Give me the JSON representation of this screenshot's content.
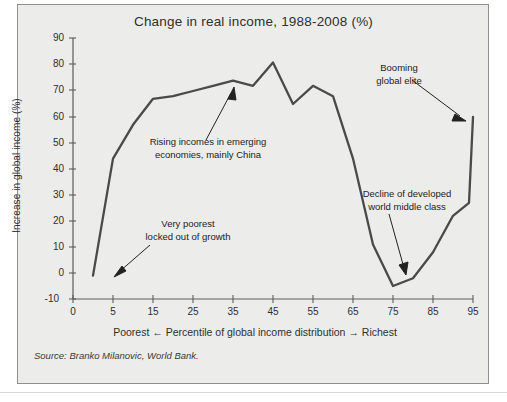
{
  "figure": {
    "title": "Change in real income, 1988-2008 (%)",
    "source": "Source: Branko Milanovic, World Bank.",
    "background_color": "#ececeb",
    "line_color": "#4a4a4a",
    "text_color": "#2f2f2f"
  },
  "annotations": {
    "poorest": {
      "line1": "Very poorest",
      "line2": "locked out of growth"
    },
    "emerging": {
      "line1": "Rising incomes in emerging",
      "line2": "economies, mainly China"
    },
    "elite": {
      "line1": "Booming",
      "line2": "global elite"
    },
    "middleclass": {
      "line1": "Decline of developed",
      "line2": "world middle class"
    }
  },
  "chart_data": {
    "type": "line",
    "title": "Change in real income, 1988-2008 (%)",
    "xlabel": "Poorest ← Percentile of global income distribution → Richest",
    "ylabel": "Increase in global income (%)",
    "xlim": [
      0,
      100
    ],
    "ylim": [
      -10,
      90
    ],
    "grid": false,
    "legend": false,
    "xticks": [
      0,
      5,
      15,
      25,
      35,
      45,
      55,
      65,
      75,
      85,
      95
    ],
    "xtick_labels": [
      "0",
      "5",
      "15",
      "25",
      "35",
      "45",
      "55",
      "65",
      "75",
      "85",
      "95"
    ],
    "yticks": [
      -10,
      0,
      10,
      20,
      30,
      40,
      50,
      60,
      70,
      80,
      90
    ],
    "ytick_labels": [
      "-10",
      "0",
      "10",
      "20",
      "30",
      "40",
      "50",
      "60",
      "70",
      "80",
      "90"
    ],
    "x": [
      5,
      10,
      15,
      20,
      25,
      30,
      35,
      40,
      45,
      50,
      55,
      60,
      65,
      70,
      75,
      80,
      85,
      90,
      95,
      99,
      100
    ],
    "y": [
      -1,
      44,
      57,
      67,
      68,
      70,
      72,
      74,
      72,
      81,
      65,
      72,
      68,
      44,
      11,
      -5,
      -2,
      8,
      22,
      27,
      60
    ],
    "series": [
      {
        "name": "Change in real income 1988-2008",
        "points": [
          {
            "percentile": 5,
            "value": -1
          },
          {
            "percentile": 10,
            "value": 44
          },
          {
            "percentile": 15,
            "value": 57
          },
          {
            "percentile": 20,
            "value": 67
          },
          {
            "percentile": 25,
            "value": 68
          },
          {
            "percentile": 30,
            "value": 70
          },
          {
            "percentile": 35,
            "value": 72
          },
          {
            "percentile": 40,
            "value": 74
          },
          {
            "percentile": 45,
            "value": 72
          },
          {
            "percentile": 50,
            "value": 81
          },
          {
            "percentile": 55,
            "value": 65
          },
          {
            "percentile": 60,
            "value": 72
          },
          {
            "percentile": 65,
            "value": 68
          },
          {
            "percentile": 70,
            "value": 44
          },
          {
            "percentile": 75,
            "value": 11
          },
          {
            "percentile": 80,
            "value": -5
          },
          {
            "percentile": 85,
            "value": -2
          },
          {
            "percentile": 90,
            "value": 8
          },
          {
            "percentile": 95,
            "value": 22
          },
          {
            "percentile": 99,
            "value": 27
          },
          {
            "percentile": 100,
            "value": 60
          }
        ]
      }
    ],
    "annotations": [
      {
        "text": "Very poorest locked out of growth",
        "target_percentile": 5,
        "target_value": 0
      },
      {
        "text": "Rising incomes in emerging economies, mainly China",
        "target_percentile": 40,
        "target_value": 74
      },
      {
        "text": "Booming global elite",
        "target_percentile": 100,
        "target_value": 60
      },
      {
        "text": "Decline of developed world middle class",
        "target_percentile": 80,
        "target_value": -5
      }
    ]
  }
}
